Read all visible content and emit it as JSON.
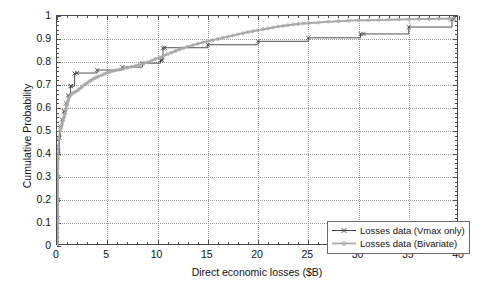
{
  "chart_data": {
    "type": "line",
    "title": "",
    "xlabel": "Direct economic losses ($B)",
    "ylabel": "Cumulative Probability",
    "xlim": [
      0,
      40
    ],
    "ylim": [
      0,
      1
    ],
    "xticks": [
      0,
      5,
      10,
      15,
      20,
      25,
      30,
      35,
      40
    ],
    "xtick_labels": [
      "0",
      "5",
      "10",
      "15",
      "20",
      "25",
      "30",
      "35",
      "40"
    ],
    "yticks": [
      0,
      0.1,
      0.2,
      0.3,
      0.4,
      0.5,
      0.6,
      0.7,
      0.8,
      0.9,
      1
    ],
    "ytick_labels": [
      "0",
      "0.1",
      "0.2",
      "0.3",
      "0.4",
      "0.5",
      "0.6",
      "0.7",
      "0.8",
      "0.9",
      "1"
    ],
    "grid": true,
    "grid_style": "dotted",
    "legend_position": "lower right",
    "series": [
      {
        "name": "Losses data (Vmax only)",
        "color": "#3c3c3c",
        "marker": "x",
        "points": [
          [
            0.05,
            0.0
          ],
          [
            0.08,
            0.12
          ],
          [
            0.1,
            0.2
          ],
          [
            0.12,
            0.3
          ],
          [
            0.15,
            0.4
          ],
          [
            0.25,
            0.47
          ],
          [
            0.35,
            0.52
          ],
          [
            0.5,
            0.55
          ],
          [
            0.7,
            0.585
          ],
          [
            0.75,
            0.585
          ],
          [
            0.9,
            0.62
          ],
          [
            1.1,
            0.655
          ],
          [
            1.35,
            0.695
          ],
          [
            1.4,
            0.695
          ],
          [
            1.75,
            0.75
          ],
          [
            2.0,
            0.752
          ],
          [
            4.0,
            0.765
          ],
          [
            6.5,
            0.778
          ],
          [
            8.5,
            0.795
          ],
          [
            10.3,
            0.808
          ],
          [
            10.45,
            0.808
          ],
          [
            10.55,
            0.86
          ],
          [
            10.7,
            0.862
          ],
          [
            15.0,
            0.875
          ],
          [
            20.0,
            0.89
          ],
          [
            25.0,
            0.905
          ],
          [
            30.2,
            0.922
          ],
          [
            30.5,
            0.922
          ],
          [
            35.0,
            0.952
          ],
          [
            39.3,
            0.985
          ],
          [
            39.5,
            0.988
          ]
        ]
      },
      {
        "name": "Losses data (Bivariate)",
        "color": "#a8a8a8",
        "marker": "o",
        "points": [
          [
            0.05,
            0.0
          ],
          [
            0.07,
            0.1
          ],
          [
            0.09,
            0.2
          ],
          [
            0.1,
            0.3
          ],
          [
            0.12,
            0.38
          ],
          [
            0.15,
            0.43
          ],
          [
            0.2,
            0.47
          ],
          [
            0.3,
            0.5
          ],
          [
            0.4,
            0.515
          ],
          [
            0.5,
            0.53
          ],
          [
            0.6,
            0.545
          ],
          [
            0.7,
            0.56
          ],
          [
            0.8,
            0.575
          ],
          [
            0.9,
            0.595
          ],
          [
            1.0,
            0.615
          ],
          [
            1.1,
            0.63
          ],
          [
            1.2,
            0.645
          ],
          [
            1.35,
            0.655
          ],
          [
            1.5,
            0.662
          ],
          [
            1.7,
            0.668
          ],
          [
            1.9,
            0.672
          ],
          [
            2.1,
            0.678
          ],
          [
            2.3,
            0.685
          ],
          [
            2.5,
            0.693
          ],
          [
            2.7,
            0.7
          ],
          [
            2.9,
            0.705
          ],
          [
            3.1,
            0.712
          ],
          [
            3.3,
            0.718
          ],
          [
            3.5,
            0.723
          ],
          [
            3.7,
            0.728
          ],
          [
            3.9,
            0.733
          ],
          [
            4.1,
            0.737
          ],
          [
            4.4,
            0.742
          ],
          [
            4.7,
            0.748
          ],
          [
            5.0,
            0.753
          ],
          [
            5.3,
            0.757
          ],
          [
            5.6,
            0.761
          ],
          [
            5.9,
            0.764
          ],
          [
            6.2,
            0.767
          ],
          [
            6.6,
            0.771
          ],
          [
            7.0,
            0.775
          ],
          [
            7.4,
            0.779
          ],
          [
            7.8,
            0.783
          ],
          [
            8.2,
            0.788
          ],
          [
            8.6,
            0.793
          ],
          [
            9.0,
            0.799
          ],
          [
            9.4,
            0.806
          ],
          [
            9.8,
            0.813
          ],
          [
            10.2,
            0.82
          ],
          [
            10.6,
            0.827
          ],
          [
            11.0,
            0.834
          ],
          [
            11.4,
            0.841
          ],
          [
            11.8,
            0.848
          ],
          [
            12.2,
            0.855
          ],
          [
            12.6,
            0.861
          ],
          [
            13.0,
            0.867
          ],
          [
            13.5,
            0.873
          ],
          [
            14.0,
            0.879
          ],
          [
            14.5,
            0.885
          ],
          [
            15.0,
            0.89
          ],
          [
            15.5,
            0.895
          ],
          [
            16.0,
            0.9
          ],
          [
            16.5,
            0.905
          ],
          [
            17.0,
            0.91
          ],
          [
            17.5,
            0.915
          ],
          [
            18.0,
            0.92
          ],
          [
            18.5,
            0.925
          ],
          [
            19.0,
            0.93
          ],
          [
            19.5,
            0.934
          ],
          [
            20.0,
            0.938
          ],
          [
            20.5,
            0.942
          ],
          [
            21.0,
            0.946
          ],
          [
            21.5,
            0.95
          ],
          [
            22.0,
            0.954
          ],
          [
            22.5,
            0.957
          ],
          [
            23.0,
            0.96
          ],
          [
            23.5,
            0.963
          ],
          [
            24.0,
            0.965
          ],
          [
            24.5,
            0.967
          ],
          [
            25.0,
            0.969
          ],
          [
            26.0,
            0.972
          ],
          [
            27.0,
            0.975
          ],
          [
            28.0,
            0.977
          ],
          [
            29.0,
            0.979
          ],
          [
            30.0,
            0.981
          ],
          [
            31.0,
            0.982
          ],
          [
            32.0,
            0.983
          ],
          [
            33.0,
            0.984
          ],
          [
            34.0,
            0.985
          ],
          [
            35.0,
            0.986
          ],
          [
            36.0,
            0.987
          ],
          [
            37.0,
            0.987
          ],
          [
            38.0,
            0.988
          ],
          [
            39.0,
            0.988
          ],
          [
            39.5,
            0.989
          ]
        ]
      }
    ]
  },
  "legend": {
    "entries": [
      {
        "label": "Losses data (Vmax only)"
      },
      {
        "label": "Losses data (Bivariate)"
      }
    ]
  }
}
